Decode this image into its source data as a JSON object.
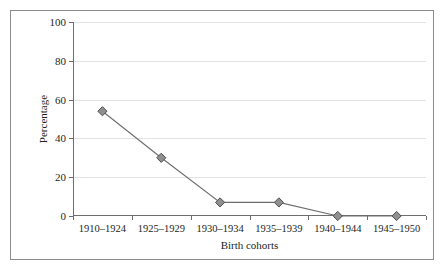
{
  "chart_data": {
    "type": "line",
    "title": "",
    "xlabel": "Birth cohorts",
    "ylabel": "Percentage",
    "categories": [
      "1910–1924",
      "1925–1929",
      "1930–1934",
      "1935–1939",
      "1940–1944",
      "1945–1950"
    ],
    "values": [
      54,
      30,
      7,
      7,
      0,
      0
    ],
    "series": [
      {
        "name": "Percentage",
        "values": [
          54,
          30,
          7,
          7,
          0,
          0
        ]
      }
    ],
    "ylim": [
      0,
      100
    ],
    "yticks": [
      0,
      20,
      40,
      60,
      80,
      100
    ],
    "ytick_labels": [
      "0",
      "20",
      "40",
      "60",
      "80",
      "100"
    ],
    "grid": "horizontal",
    "legend": "none",
    "marker": "diamond",
    "colors": {
      "line": "#6d6d6d",
      "marker_fill": "#8f8f8f",
      "marker_stroke": "#4f4f4f",
      "gridline": "#e3e3e3",
      "axis": "#6d6d6d",
      "frame": "#8c8c8c",
      "text": "#231f20",
      "background": "#ffffff"
    }
  }
}
